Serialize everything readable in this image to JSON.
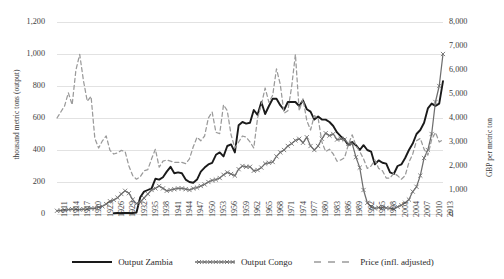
{
  "chart_data": {
    "type": "line",
    "title": "",
    "xlabel": "",
    "ylabel": "thousand metric tons (output)",
    "ylabel_right": "GBP per metric ton",
    "ylim": [
      0,
      1200
    ],
    "ylim_right": [
      0,
      8000
    ],
    "grid": true,
    "legend_position": "bottom",
    "x_tick_step": 3,
    "x_ticks": [
      "1911",
      "1914",
      "1917",
      "1920",
      "1923",
      "1926",
      "1929",
      "1932",
      "1935",
      "1938",
      "1941",
      "1944",
      "1947",
      "1950",
      "1953",
      "1956",
      "1959",
      "1962",
      "1965",
      "1968",
      "1971",
      "1974",
      "1977",
      "1980",
      "1983",
      "1986",
      "1989",
      "1992",
      "1995",
      "1998",
      "2001",
      "2004",
      "2007",
      "2010",
      "2013"
    ],
    "y_ticks_left": [
      "0",
      "200",
      "400",
      "600",
      "800",
      "1,000",
      "1,200"
    ],
    "y_ticks_right": [
      "0",
      "1,000",
      "2,000",
      "3,000",
      "4,000",
      "5,000",
      "6,000",
      "7,000",
      "8,000"
    ],
    "x": [
      1911,
      1912,
      1913,
      1914,
      1915,
      1916,
      1917,
      1918,
      1919,
      1920,
      1921,
      1922,
      1923,
      1924,
      1925,
      1926,
      1927,
      1928,
      1929,
      1930,
      1931,
      1932,
      1933,
      1934,
      1935,
      1936,
      1937,
      1938,
      1939,
      1940,
      1941,
      1942,
      1943,
      1944,
      1945,
      1946,
      1947,
      1948,
      1949,
      1950,
      1951,
      1952,
      1953,
      1954,
      1955,
      1956,
      1957,
      1958,
      1959,
      1960,
      1961,
      1962,
      1963,
      1964,
      1965,
      1966,
      1967,
      1968,
      1969,
      1970,
      1971,
      1972,
      1973,
      1974,
      1975,
      1976,
      1977,
      1978,
      1979,
      1980,
      1981,
      1982,
      1983,
      1984,
      1985,
      1986,
      1987,
      1988,
      1989,
      1990,
      1991,
      1992,
      1993,
      1994,
      1995,
      1996,
      1997,
      1998,
      1999,
      2000,
      2001,
      2002,
      2003,
      2004,
      2005,
      2006,
      2007,
      2008,
      2009,
      2010,
      2011,
      2012,
      2013
    ],
    "series": [
      {
        "name": "Output Zambia",
        "axis": "left",
        "units": "thousand metric tons",
        "color": "#1a1a1a",
        "style": "solid",
        "marker": "none",
        "values": [
          null,
          null,
          null,
          null,
          null,
          null,
          null,
          null,
          null,
          null,
          null,
          null,
          null,
          null,
          null,
          5,
          6,
          6,
          6,
          6,
          6,
          9,
          105,
          140,
          150,
          160,
          220,
          215,
          230,
          265,
          295,
          255,
          260,
          255,
          215,
          200,
          195,
          215,
          265,
          290,
          310,
          320,
          370,
          385,
          360,
          425,
          435,
          385,
          555,
          575,
          565,
          570,
          650,
          620,
          700,
          625,
          675,
          720,
          720,
          680,
          650,
          700,
          700,
          700,
          675,
          710,
          655,
          640,
          590,
          610,
          590,
          590,
          575,
          550,
          510,
          485,
          465,
          430,
          450,
          430,
          400,
          430,
          400,
          390,
          310,
          335,
          320,
          315,
          260,
          250,
          300,
          310,
          350,
          400,
          440,
          500,
          525,
          570,
          660,
          690,
          675,
          690,
          830
        ]
      },
      {
        "name": "Output Congo",
        "axis": "left",
        "units": "thousand metric tons",
        "color": "#6e6e6e",
        "style": "solid",
        "marker": "x",
        "values": [
          20,
          22,
          25,
          28,
          30,
          30,
          28,
          30,
          32,
          35,
          35,
          42,
          48,
          62,
          80,
          88,
          102,
          125,
          145,
          130,
          90,
          65,
          75,
          100,
          125,
          150,
          160,
          175,
          160,
          145,
          150,
          155,
          160,
          160,
          155,
          150,
          160,
          165,
          175,
          185,
          200,
          210,
          215,
          225,
          245,
          260,
          250,
          240,
          280,
          300,
          295,
          295,
          270,
          275,
          290,
          315,
          320,
          325,
          360,
          385,
          400,
          425,
          440,
          460,
          470,
          445,
          480,
          425,
          400,
          425,
          470,
          505,
          490,
          500,
          465,
          470,
          465,
          440,
          440,
          355,
          290,
          150,
          70,
          45,
          35,
          40,
          40,
          38,
          35,
          32,
          45,
          55,
          70,
          90,
          140,
          170,
          240,
          350,
          400,
          500,
          700,
          800,
          1000
        ]
      },
      {
        "name": "Price (infl. adjusted)",
        "axis": "right",
        "units": "GBP per metric ton",
        "color": "#9a9a9a",
        "style": "dashed",
        "marker": "none",
        "values": [
          4000,
          4250,
          4500,
          5050,
          4550,
          6000,
          6650,
          5550,
          4700,
          4900,
          3150,
          2750,
          3050,
          3250,
          2650,
          2500,
          2550,
          2650,
          2600,
          2000,
          1600,
          1450,
          1550,
          1800,
          1850,
          2300,
          2700,
          1950,
          2200,
          2250,
          2200,
          2150,
          2150,
          2150,
          2100,
          2300,
          2800,
          3200,
          3050,
          3250,
          4000,
          4250,
          3400,
          3350,
          4550,
          4300,
          3300,
          2750,
          3000,
          3250,
          3200,
          3000,
          2750,
          4000,
          4550,
          5250,
          4650,
          4950,
          6050,
          5400,
          4200,
          4300,
          5300,
          6650,
          4300,
          4800,
          3900,
          3500,
          4100,
          4000,
          3000,
          2600,
          2700,
          2500,
          2200,
          2250,
          2350,
          2900,
          3300,
          2850,
          2600,
          2300,
          1900,
          2000,
          2250,
          1900,
          1800,
          1500,
          1500,
          1700,
          1600,
          1450,
          1600,
          2150,
          2500,
          3050,
          3150,
          2700,
          2450,
          3100,
          3400,
          3000,
          3100
        ]
      }
    ]
  },
  "legend": {
    "items": [
      {
        "label": "Output Zambia",
        "icon": "solid-line-swatch"
      },
      {
        "label": "Output Congo",
        "icon": "x-marker-line-swatch"
      },
      {
        "label": "Price (infl. adjusted)",
        "icon": "dashed-line-swatch"
      }
    ]
  },
  "colors": {
    "zambia": "#1a1a1a",
    "congo": "#6e6e6e",
    "price": "#9a9a9a",
    "grid": "#e2e2e2",
    "text": "#3c3c3c"
  }
}
